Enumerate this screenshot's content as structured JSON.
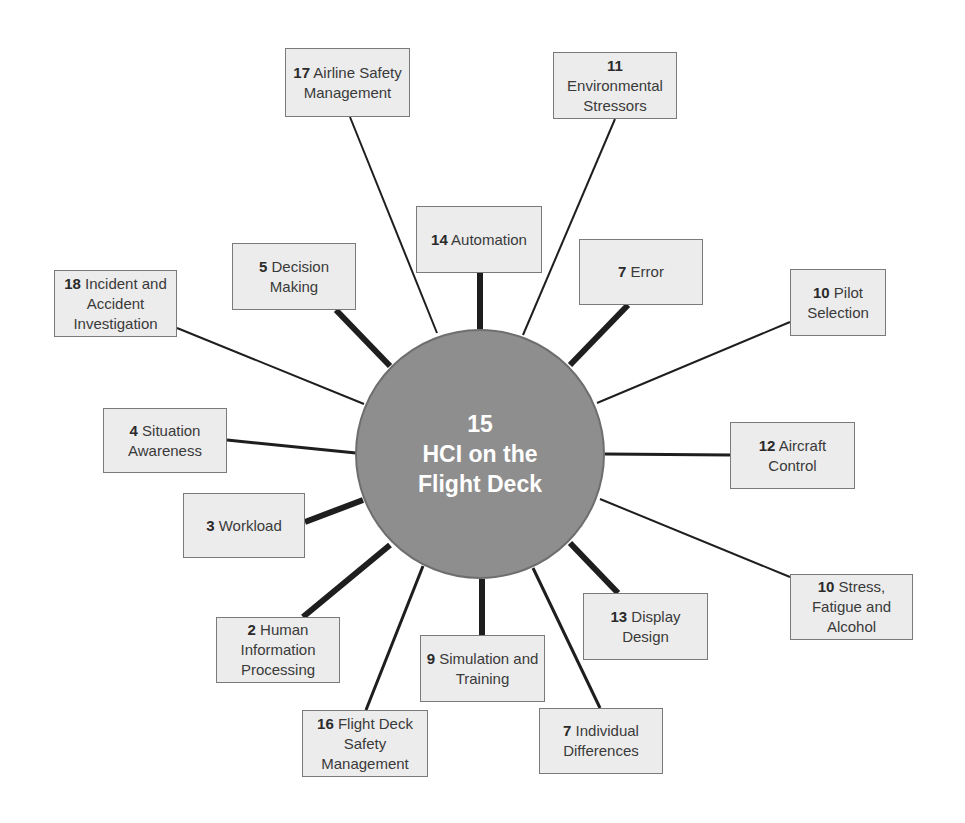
{
  "hub": {
    "number": "15",
    "title_line1": "HCI on the",
    "title_line2": "Flight Deck",
    "fill_color": "#8e8e8e",
    "cx": 480,
    "cy": 454,
    "r": 125
  },
  "nodes": [
    {
      "id": "n17",
      "number": "17",
      "text": "Airline Safety Management",
      "x": 285,
      "y": 48,
      "w": 125,
      "h": 69,
      "line_to": [
        437,
        333
      ],
      "line_from": [
        350,
        117
      ],
      "weight": 2
    },
    {
      "id": "n11",
      "number": "11",
      "text": "Environmental Stressors",
      "x": 553,
      "y": 52,
      "w": 124,
      "h": 67,
      "line_to": [
        523,
        335
      ],
      "line_from": [
        615,
        119
      ],
      "weight": 2
    },
    {
      "id": "n14",
      "number": "14",
      "text": "Automation",
      "x": 416,
      "y": 206,
      "w": 126,
      "h": 67,
      "line_to": [
        480,
        329
      ],
      "line_from": [
        480,
        273
      ],
      "weight": 6
    },
    {
      "id": "n5",
      "number": "5",
      "text": "Decision Making",
      "x": 232,
      "y": 243,
      "w": 124,
      "h": 67,
      "line_to": [
        390,
        366
      ],
      "line_from": [
        336,
        310
      ],
      "weight": 6
    },
    {
      "id": "n7e",
      "number": "7",
      "text": "Error",
      "x": 579,
      "y": 239,
      "w": 124,
      "h": 66,
      "line_to": [
        570,
        365
      ],
      "line_from": [
        628,
        305
      ],
      "weight": 6
    },
    {
      "id": "n18",
      "number": "18",
      "text": "Incident and Accident Investigation",
      "x": 54,
      "y": 270,
      "w": 123,
      "h": 67,
      "line_to": [
        364,
        404
      ],
      "line_from": [
        177,
        328
      ],
      "weight": 2
    },
    {
      "id": "n10p",
      "number": "10",
      "text": "Pilot Selection",
      "x": 790,
      "y": 269,
      "w": 96,
      "h": 67,
      "line_to": [
        597,
        403
      ],
      "line_from": [
        790,
        322
      ],
      "weight": 2
    },
    {
      "id": "n4",
      "number": "4",
      "text": "Situation Awareness",
      "x": 103,
      "y": 408,
      "w": 124,
      "h": 65,
      "line_to": [
        356,
        453
      ],
      "line_from": [
        227,
        440
      ],
      "weight": 3
    },
    {
      "id": "n12",
      "number": "12",
      "text": "Aircraft Control",
      "x": 730,
      "y": 422,
      "w": 125,
      "h": 67,
      "line_to": [
        605,
        454
      ],
      "line_from": [
        730,
        455
      ],
      "weight": 3
    },
    {
      "id": "n3",
      "number": "3",
      "text": "Workload",
      "x": 183,
      "y": 493,
      "w": 122,
      "h": 65,
      "line_to": [
        363,
        500
      ],
      "line_from": [
        305,
        522
      ],
      "weight": 6
    },
    {
      "id": "n10s",
      "number": "10",
      "text": "Stress, Fatigue and Alcohol",
      "x": 790,
      "y": 574,
      "w": 123,
      "h": 66,
      "line_to": [
        600,
        499
      ],
      "line_from": [
        790,
        577
      ],
      "weight": 2
    },
    {
      "id": "n13",
      "number": "13",
      "text": "Display Design",
      "x": 583,
      "y": 593,
      "w": 125,
      "h": 67,
      "line_to": [
        570,
        543
      ],
      "line_from": [
        618,
        593
      ],
      "weight": 6
    },
    {
      "id": "n2",
      "number": "2",
      "text": "Human Information Processing",
      "x": 216,
      "y": 617,
      "w": 124,
      "h": 66,
      "line_to": [
        390,
        545
      ],
      "line_from": [
        303,
        617
      ],
      "weight": 6
    },
    {
      "id": "n9",
      "number": "9",
      "text": "Simulation and Training",
      "x": 420,
      "y": 635,
      "w": 125,
      "h": 67,
      "line_to": [
        482,
        579
      ],
      "line_from": [
        482,
        635
      ],
      "weight": 6
    },
    {
      "id": "n16",
      "number": "16",
      "text": "Flight Deck Safety Management",
      "x": 302,
      "y": 710,
      "w": 126,
      "h": 67,
      "line_to": [
        423,
        566
      ],
      "line_from": [
        366,
        710
      ],
      "weight": 3
    },
    {
      "id": "n7i",
      "number": "7",
      "text": "Individual Differences",
      "x": 539,
      "y": 708,
      "w": 124,
      "h": 66,
      "line_to": [
        533,
        568
      ],
      "line_from": [
        600,
        708
      ],
      "weight": 3
    }
  ],
  "colors": {
    "box_fill": "#ececec",
    "box_border": "#7a7a7a",
    "connector": "#1e1e1e",
    "hub_text": "#ffffff"
  }
}
